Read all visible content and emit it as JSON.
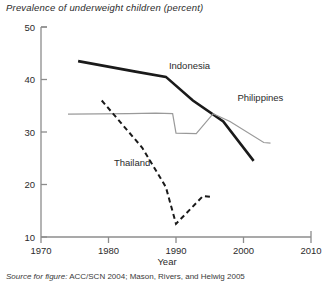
{
  "chart_data": {
    "type": "line",
    "title": "Prevalence of underweight children (percent)",
    "xlabel": "Year",
    "ylabel": "",
    "xlim": [
      1970,
      2010
    ],
    "ylim": [
      10,
      50
    ],
    "xticks": [
      "1970",
      "1980",
      "1990",
      "2000",
      "2010"
    ],
    "yticks": [
      "10",
      "20",
      "30",
      "40",
      "50"
    ],
    "grid": false,
    "legend_position": "inline-labels",
    "annotations": [
      {
        "text": "Indonesia",
        "x": 1992,
        "y": 42.0
      },
      {
        "text": "Philippines",
        "x": 2002.5,
        "y": 36.0
      },
      {
        "text": "Thailand",
        "x": 1983.5,
        "y": 23.5
      }
    ],
    "series": [
      {
        "name": "Indonesia",
        "style": "solid-thick-black",
        "color": "#1a1a1a",
        "x": [
          1975.5,
          1984.0,
          1988.5,
          1992.5,
          1997.0,
          2001.5
        ],
        "y": [
          43.5,
          41.5,
          40.5,
          36.0,
          32.0,
          24.5
        ]
      },
      {
        "name": "Philippines",
        "style": "solid-thin-gray",
        "color": "#9a9a9a",
        "x": [
          1974.0,
          1983.0,
          1987.0,
          1989.5,
          1990.0,
          1993.0,
          1995.5,
          1998.0,
          2003.0,
          2004.0
        ],
        "y": [
          33.4,
          33.5,
          33.6,
          33.5,
          29.8,
          29.7,
          33.5,
          32.0,
          28.0,
          27.9
        ]
      },
      {
        "name": "Thailand",
        "style": "dashed-black",
        "color": "#1a1a1a",
        "x": [
          1979.0,
          1985.0,
          1988.5,
          1990.0,
          1994.0,
          1995.5
        ],
        "y": [
          36.0,
          27.0,
          19.5,
          12.5,
          17.8,
          17.6
        ]
      }
    ]
  },
  "source": {
    "label": "Source for figure:",
    "text": " ACC/SCN 2004; Mason, Rivers, and Helwig 2005"
  }
}
